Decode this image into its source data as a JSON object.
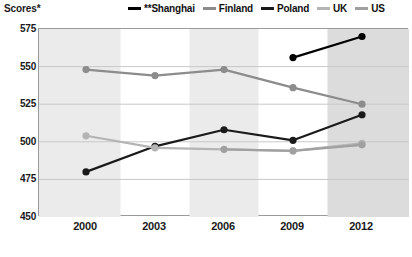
{
  "axis_title": "Scores*",
  "legend": {
    "position": "top-right",
    "items": [
      {
        "label": "**Shanghai",
        "color": "#000000",
        "key": "shanghai"
      },
      {
        "label": "Finland",
        "color": "#8c8c8c",
        "key": "finland"
      },
      {
        "label": "Poland",
        "color": "#1a1a1a",
        "key": "poland"
      },
      {
        "label": "UK",
        "color": "#b4b4b4",
        "key": "uk"
      },
      {
        "label": "US",
        "color": "#a0a0a0",
        "key": "us"
      }
    ]
  },
  "chart_data": {
    "type": "line",
    "title": "",
    "subtitle": "",
    "xlabel": "",
    "ylabel": "Scores*",
    "categories": [
      "2000",
      "2003",
      "2006",
      "2009",
      "2012"
    ],
    "x": [
      2000,
      2003,
      2006,
      2009,
      2012
    ],
    "ylim": [
      450,
      575
    ],
    "yticks": [
      450,
      475,
      500,
      525,
      550,
      575
    ],
    "ytick_labels": [
      "450",
      "475",
      "500",
      "525",
      "550",
      "575"
    ],
    "grid": "horizontal",
    "legend_position": "top-right",
    "band_shading": "alternating vertical gray bands centered on 2000, 2006, 2012",
    "series": [
      {
        "name": "**Shanghai",
        "color": "#000000",
        "values": [
          null,
          null,
          null,
          556,
          570
        ],
        "marker": "circle"
      },
      {
        "name": "Finland",
        "color": "#8c8c8c",
        "values": [
          548,
          544,
          548,
          536,
          525
        ],
        "marker": "circle"
      },
      {
        "name": "Poland",
        "color": "#1a1a1a",
        "values": [
          480,
          497,
          508,
          501,
          518
        ],
        "marker": "circle"
      },
      {
        "name": "UK",
        "color": "#b4b4b4",
        "values": [
          504,
          496,
          null,
          494,
          499
        ],
        "marker": "circle"
      },
      {
        "name": "US",
        "color": "#a0a0a0",
        "values": [
          null,
          null,
          495,
          494,
          498
        ],
        "marker": "circle"
      }
    ]
  },
  "colors": {
    "band": "#ebebeb",
    "band_dark": "#dcdcdc",
    "grid": "#c8c8c8",
    "frame": "#9a9a9a",
    "text": "#1a1a1a",
    "background": "#ffffff"
  }
}
